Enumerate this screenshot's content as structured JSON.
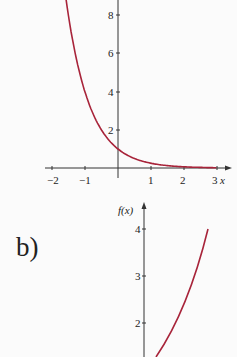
{
  "panel_b_label": "b)",
  "chart_data": [
    {
      "type": "line",
      "title": "",
      "function": "f(x) = (1/4)^x",
      "xlabel": "x",
      "ylabel": "",
      "x_ticks": [
        "−2",
        "−1",
        "1",
        "2",
        "3"
      ],
      "y_ticks": [
        "2",
        "4",
        "6",
        "8"
      ],
      "xlim": [
        -2.2,
        3.2
      ],
      "ylim": [
        0,
        8.8
      ],
      "grid": false,
      "series": [
        {
          "name": "f(x)",
          "color": "#a8243a",
          "x": [
            -1.55,
            -1.25,
            -1,
            -0.75,
            -0.5,
            -0.25,
            0,
            0.5,
            1,
            1.5,
            2,
            2.5,
            3
          ],
          "y": [
            8.6,
            5.66,
            4,
            2.83,
            2,
            1.41,
            1,
            0.5,
            0.25,
            0.125,
            0.06,
            0.03,
            0.02
          ]
        }
      ]
    },
    {
      "type": "line",
      "title": "",
      "ylabel": "f(x)",
      "y_ticks": [
        "2",
        "3",
        "4"
      ],
      "ylim": [
        1.3,
        4.3
      ],
      "grid": false,
      "series": [
        {
          "name": "f(x)",
          "color": "#a8243a",
          "points_px_note": "increasing convex curve from about y=1.3 to y=4"
        }
      ]
    }
  ]
}
